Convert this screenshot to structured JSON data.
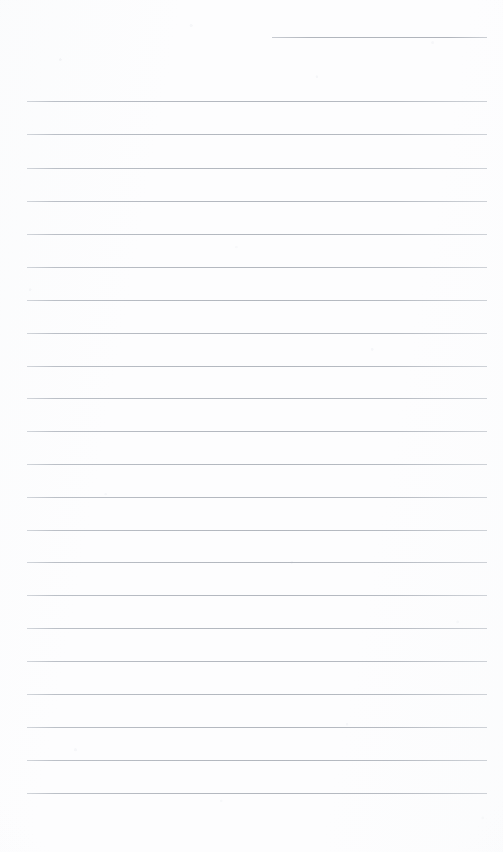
{
  "document": {
    "type": "lined-notepad-page",
    "title": "Blank Lined Notepad Page",
    "description": "Scanned blank ruled notepad sheet with no handwriting, text, header, or margin rule",
    "content_text": "",
    "is_blank": true,
    "page_width": 503,
    "page_height": 852
  },
  "paper": {
    "background_color": "#fdfdfe",
    "rule_color": "#b8bcc4",
    "rule_thickness_px": 1,
    "rule_spacing_px": 32.7,
    "rule_left_x": 27,
    "rule_right_x": 487,
    "rule_count": 23,
    "top_margin_px": 37,
    "bottom_margin_px": 59
  },
  "rules": [
    {
      "index": 1,
      "y": 37,
      "x1": 272,
      "x2": 487,
      "style": "partial"
    },
    {
      "index": 2,
      "y": 101,
      "x1": 27,
      "x2": 487,
      "style": "full"
    },
    {
      "index": 3,
      "y": 134,
      "x1": 27,
      "x2": 487,
      "style": "full"
    },
    {
      "index": 4,
      "y": 168,
      "x1": 27,
      "x2": 487,
      "style": "full"
    },
    {
      "index": 5,
      "y": 201,
      "x1": 27,
      "x2": 487,
      "style": "full"
    },
    {
      "index": 6,
      "y": 234,
      "x1": 27,
      "x2": 487,
      "style": "full"
    },
    {
      "index": 7,
      "y": 267,
      "x1": 27,
      "x2": 487,
      "style": "full"
    },
    {
      "index": 8,
      "y": 300,
      "x1": 27,
      "x2": 487,
      "style": "full"
    },
    {
      "index": 9,
      "y": 333,
      "x1": 27,
      "x2": 487,
      "style": "full"
    },
    {
      "index": 10,
      "y": 366,
      "x1": 27,
      "x2": 487,
      "style": "full"
    },
    {
      "index": 11,
      "y": 398,
      "x1": 27,
      "x2": 487,
      "style": "full"
    },
    {
      "index": 12,
      "y": 431,
      "x1": 27,
      "x2": 487,
      "style": "full"
    },
    {
      "index": 13,
      "y": 464,
      "x1": 27,
      "x2": 487,
      "style": "full"
    },
    {
      "index": 14,
      "y": 497,
      "x1": 27,
      "x2": 487,
      "style": "full"
    },
    {
      "index": 15,
      "y": 530,
      "x1": 27,
      "x2": 487,
      "style": "full"
    },
    {
      "index": 16,
      "y": 562,
      "x1": 27,
      "x2": 487,
      "style": "full"
    },
    {
      "index": 17,
      "y": 595,
      "x1": 27,
      "x2": 487,
      "style": "full"
    },
    {
      "index": 18,
      "y": 628,
      "x1": 27,
      "x2": 487,
      "style": "full"
    },
    {
      "index": 19,
      "y": 661,
      "x1": 27,
      "x2": 487,
      "style": "full"
    },
    {
      "index": 20,
      "y": 694,
      "x1": 27,
      "x2": 487,
      "style": "full"
    },
    {
      "index": 21,
      "y": 727,
      "x1": 27,
      "x2": 487,
      "style": "full"
    },
    {
      "index": 22,
      "y": 760,
      "x1": 27,
      "x2": 487,
      "style": "full"
    },
    {
      "index": 23,
      "y": 793,
      "x1": 27,
      "x2": 487,
      "style": "full"
    }
  ]
}
